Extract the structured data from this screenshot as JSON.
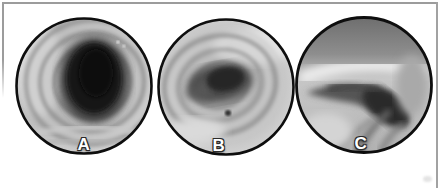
{
  "figure": {
    "background": "#ffffff",
    "frame_color": "#9c9c9c",
    "rim_color": "#0e0e0e",
    "label_color": "#ffffff",
    "panels": [
      {
        "label": "A",
        "name": "endoscopy-open-tracheal-lumen"
      },
      {
        "label": "B",
        "name": "endoscopy-narrowed-lumen"
      },
      {
        "label": "C",
        "name": "endoscopy-collapsed-airway-slit"
      }
    ]
  }
}
